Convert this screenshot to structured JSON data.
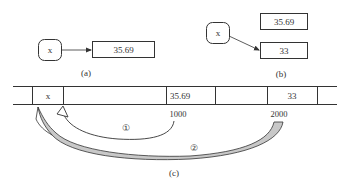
{
  "panel_a": {
    "variable_label": "x",
    "value_box": "35.69",
    "caption": "(a)"
  },
  "panel_b": {
    "variable_label": "x",
    "old_value_box": "35.69",
    "new_value_box": "33",
    "caption": "(b)"
  },
  "panel_c": {
    "memory_cells": [
      {
        "text": ""
      },
      {
        "text": "x"
      },
      {
        "text": ""
      },
      {
        "text": "35.69"
      },
      {
        "text": ""
      },
      {
        "text": "33"
      },
      {
        "text": ""
      }
    ],
    "address_1": "1000",
    "address_2": "2000",
    "step_1_marker": "①",
    "step_2_marker": "②",
    "caption": "(c)"
  },
  "colors": {
    "line": "#333333",
    "arrow_fill": "#c8c8c8",
    "background": "#ffffff"
  }
}
